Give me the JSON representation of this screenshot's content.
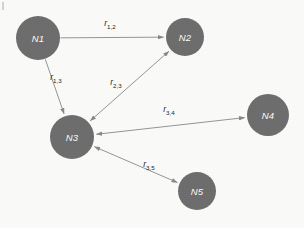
{
  "diagram": {
    "type": "directed-graph",
    "background_color": "#fbfbfa",
    "node_fill_color": "#6e6e6e",
    "node_label_color": "#ffffff",
    "edge_color": "#8a8a8a",
    "edge_label_color": "#1f1f1f",
    "nodes": [
      {
        "id": "N1",
        "label": "N1",
        "cx": 38,
        "cy": 38,
        "r": 22
      },
      {
        "id": "N2",
        "label": "N2",
        "cx": 185,
        "cy": 37,
        "r": 19
      },
      {
        "id": "N3",
        "label": "N3",
        "cx": 72,
        "cy": 137,
        "r": 22
      },
      {
        "id": "N4",
        "label": "N4",
        "cx": 268,
        "cy": 115,
        "r": 21
      },
      {
        "id": "N5",
        "label": "N5",
        "cx": 197,
        "cy": 191,
        "r": 19
      }
    ],
    "edges": [
      {
        "id": "e12",
        "from": "N1",
        "to": "N2",
        "label_base": "r",
        "label_sub": "1,2",
        "label_full": "r1,2",
        "direction": "one-way",
        "arrow_at_start": false,
        "arrow_at_end": true,
        "label_x": 110,
        "label_y": 26
      },
      {
        "id": "e13",
        "from": "N1",
        "to": "N3",
        "label_base": "r",
        "label_sub": "1,3",
        "label_full": "r1,3",
        "direction": "one-way",
        "arrow_at_start": false,
        "arrow_at_end": true,
        "label_x": 56,
        "label_y": 80
      },
      {
        "id": "e23",
        "from": "N2",
        "to": "N3",
        "label_base": "r",
        "label_sub": "2,3",
        "label_full": "r2,3",
        "direction": "two-way",
        "arrow_at_start": true,
        "arrow_at_end": true,
        "label_x": 116,
        "label_y": 85
      },
      {
        "id": "e34",
        "from": "N3",
        "to": "N4",
        "label_base": "r",
        "label_sub": "3,4",
        "label_full": "r3,4",
        "direction": "two-way",
        "arrow_at_start": true,
        "arrow_at_end": true,
        "label_x": 169,
        "label_y": 112
      },
      {
        "id": "e35",
        "from": "N3",
        "to": "N5",
        "label_base": "r",
        "label_sub": "3,5",
        "label_full": "r3,5",
        "direction": "two-way",
        "arrow_at_start": true,
        "arrow_at_end": true,
        "label_x": 149,
        "label_y": 167
      }
    ]
  }
}
